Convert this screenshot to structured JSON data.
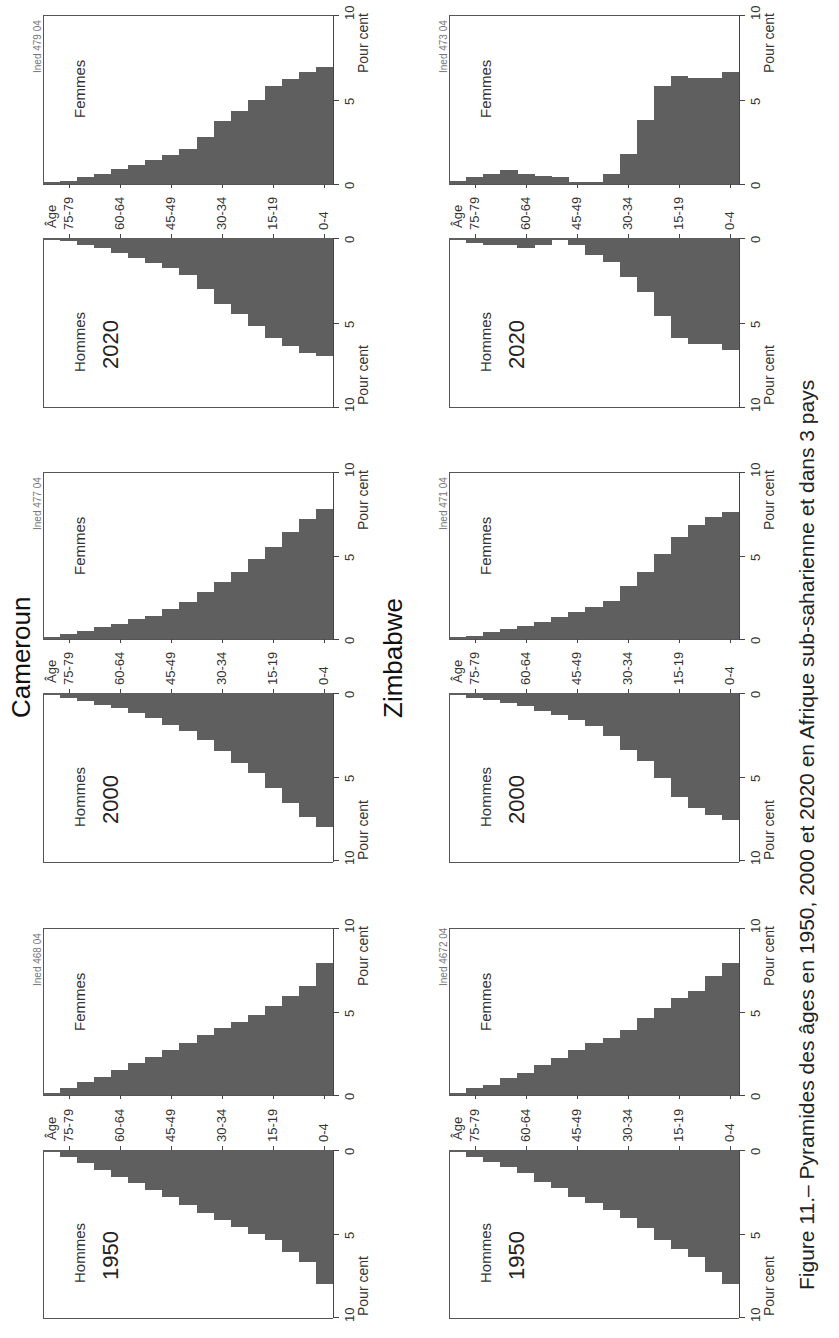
{
  "caption": "Figure 11.– Pyramides des âges en 1950, 2000 et 2020 en Afrique sub-saharienne et dans 3 pays",
  "labels": {
    "hommes": "Hommes",
    "femmes": "Femmes",
    "age_axis": "Âge",
    "unit": "Pour cent",
    "pct_ticks": [
      "0",
      "5",
      "10"
    ],
    "age_ticks": [
      "0-4",
      "15-19",
      "30-34",
      "45-49",
      "60-64",
      "75-79"
    ]
  },
  "countries": [
    {
      "name": "Cameroun"
    },
    {
      "name": "Zimbabwe"
    }
  ],
  "colors": {
    "bar": "#5f5f5f",
    "frame": "#555555",
    "background": "#ffffff"
  },
  "chart_data": [
    {
      "type": "bar",
      "title": "Cameroun 2020",
      "country": "Cameroun",
      "year": "2020",
      "source_tag": "Ined 479 04",
      "orientation": "horizontal population pyramid (image rotated 90° CCW)",
      "categories": [
        "0-4",
        "5-9",
        "10-14",
        "15-19",
        "20-24",
        "25-29",
        "30-34",
        "35-39",
        "40-44",
        "45-49",
        "50-54",
        "55-59",
        "60-64",
        "65-69",
        "70-74",
        "75-79",
        "80+"
      ],
      "series": [
        {
          "name": "Hommes",
          "values": [
            7.0,
            6.8,
            6.4,
            5.9,
            5.2,
            4.5,
            3.9,
            3.0,
            2.2,
            1.8,
            1.5,
            1.2,
            0.9,
            0.6,
            0.4,
            0.2,
            0.1
          ]
        },
        {
          "name": "Femmes",
          "values": [
            6.9,
            6.6,
            6.2,
            5.8,
            5.0,
            4.3,
            3.7,
            2.8,
            2.1,
            1.7,
            1.4,
            1.1,
            0.9,
            0.6,
            0.4,
            0.2,
            0.1
          ]
        }
      ],
      "xlabel": "Pour cent",
      "ylabel": "Âge",
      "xlim": [
        0,
        10
      ]
    },
    {
      "type": "bar",
      "title": "Cameroun 2000",
      "country": "Cameroun",
      "year": "2000",
      "source_tag": "Ined 477 04",
      "categories": [
        "0-4",
        "5-9",
        "10-14",
        "15-19",
        "20-24",
        "25-29",
        "30-34",
        "35-39",
        "40-44",
        "45-49",
        "50-54",
        "55-59",
        "60-64",
        "65-69",
        "70-74",
        "75-79",
        "80+"
      ],
      "series": [
        {
          "name": "Hommes",
          "values": [
            8.0,
            7.4,
            6.6,
            5.7,
            4.8,
            4.2,
            3.5,
            2.8,
            2.3,
            1.9,
            1.5,
            1.2,
            0.9,
            0.7,
            0.5,
            0.3,
            0.1
          ]
        },
        {
          "name": "Femmes",
          "values": [
            7.8,
            7.2,
            6.4,
            5.5,
            4.8,
            4.0,
            3.4,
            2.8,
            2.2,
            1.8,
            1.4,
            1.2,
            0.9,
            0.7,
            0.5,
            0.3,
            0.1
          ]
        }
      ],
      "xlabel": "Pour cent",
      "ylabel": "Âge",
      "xlim": [
        0,
        10
      ]
    },
    {
      "type": "bar",
      "title": "Cameroun 1950",
      "country": "Cameroun",
      "year": "1950",
      "source_tag": "Ined 468 04",
      "categories": [
        "0-4",
        "5-9",
        "10-14",
        "15-19",
        "20-24",
        "25-29",
        "30-34",
        "35-39",
        "40-44",
        "45-49",
        "50-54",
        "55-59",
        "60-64",
        "65-69",
        "70-74",
        "75-79",
        "80+"
      ],
      "series": [
        {
          "name": "Hommes",
          "values": [
            8.0,
            6.7,
            6.1,
            5.4,
            5.0,
            4.6,
            4.2,
            3.8,
            3.3,
            2.8,
            2.4,
            2.0,
            1.6,
            1.2,
            0.8,
            0.4,
            0.1
          ]
        },
        {
          "name": "Femmes",
          "values": [
            7.9,
            6.5,
            5.9,
            5.3,
            4.8,
            4.4,
            4.0,
            3.6,
            3.1,
            2.7,
            2.3,
            1.9,
            1.5,
            1.1,
            0.8,
            0.4,
            0.1
          ]
        }
      ],
      "xlabel": "Pour cent",
      "ylabel": "Âge",
      "xlim": [
        0,
        10
      ]
    },
    {
      "type": "bar",
      "title": "Zimbabwe 2020",
      "country": "Zimbabwe",
      "year": "2020",
      "source_tag": "Ined 473 04",
      "categories": [
        "0-4",
        "5-9",
        "10-14",
        "15-19",
        "20-24",
        "25-29",
        "30-34",
        "35-39",
        "40-44",
        "45-49",
        "50-54",
        "55-59",
        "60-64",
        "65-69",
        "70-74",
        "75-79",
        "80+"
      ],
      "series": [
        {
          "name": "Hommes",
          "values": [
            6.6,
            6.3,
            6.3,
            5.9,
            4.6,
            3.2,
            2.3,
            1.4,
            1.0,
            0.4,
            0.1,
            0.4,
            0.6,
            0.4,
            0.4,
            0.3,
            0.1
          ]
        },
        {
          "name": "Femmes",
          "values": [
            6.6,
            6.3,
            6.3,
            6.4,
            5.8,
            3.8,
            1.8,
            0.6,
            0.1,
            0.1,
            0.4,
            0.5,
            0.6,
            0.8,
            0.6,
            0.4,
            0.2
          ]
        }
      ],
      "xlabel": "Pour cent",
      "ylabel": "Âge",
      "xlim": [
        0,
        10
      ]
    },
    {
      "type": "bar",
      "title": "Zimbabwe 2000",
      "country": "Zimbabwe",
      "year": "2000",
      "source_tag": "Ined 471 04",
      "categories": [
        "0-4",
        "5-9",
        "10-14",
        "15-19",
        "20-24",
        "25-29",
        "30-34",
        "35-39",
        "40-44",
        "45-49",
        "50-54",
        "55-59",
        "60-64",
        "65-69",
        "70-74",
        "75-79",
        "80+"
      ],
      "series": [
        {
          "name": "Hommes",
          "values": [
            7.6,
            7.3,
            6.9,
            6.2,
            5.1,
            4.1,
            3.4,
            2.6,
            2.0,
            1.6,
            1.3,
            1.1,
            0.8,
            0.6,
            0.4,
            0.3,
            0.1
          ]
        },
        {
          "name": "Femmes",
          "values": [
            7.6,
            7.3,
            6.8,
            6.1,
            5.1,
            4.0,
            3.2,
            2.3,
            1.9,
            1.6,
            1.3,
            1.0,
            0.8,
            0.6,
            0.4,
            0.2,
            0.1
          ]
        }
      ],
      "xlabel": "Pour cent",
      "ylabel": "Âge",
      "xlim": [
        0,
        10
      ]
    },
    {
      "type": "bar",
      "title": "Zimbabwe 1950",
      "country": "Zimbabwe",
      "year": "1950",
      "source_tag": "Ined 4672 04",
      "categories": [
        "0-4",
        "5-9",
        "10-14",
        "15-19",
        "20-24",
        "25-29",
        "30-34",
        "35-39",
        "40-44",
        "45-49",
        "50-54",
        "55-59",
        "60-64",
        "65-69",
        "70-74",
        "75-79",
        "80+"
      ],
      "series": [
        {
          "name": "Hommes",
          "values": [
            8.0,
            7.3,
            6.4,
            5.9,
            5.4,
            4.7,
            4.1,
            3.6,
            3.2,
            2.8,
            2.3,
            1.9,
            1.4,
            1.0,
            0.7,
            0.4,
            0.1
          ]
        },
        {
          "name": "Femmes",
          "values": [
            7.9,
            7.1,
            6.2,
            5.8,
            5.2,
            4.6,
            3.9,
            3.4,
            3.1,
            2.7,
            2.2,
            1.8,
            1.3,
            1.0,
            0.6,
            0.4,
            0.1
          ]
        }
      ],
      "xlabel": "Pour cent",
      "ylabel": "Âge",
      "xlim": [
        0,
        10
      ]
    }
  ]
}
